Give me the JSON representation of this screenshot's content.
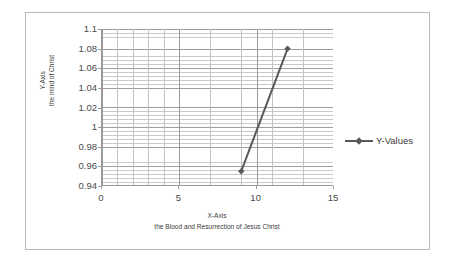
{
  "chart_data": {
    "type": "line",
    "title": "",
    "xlabel": "X-Axis\nthe Blood and Resurrection of Jesus Christ",
    "xlabel_line1": "X-Axis",
    "xlabel_line2": "the Blood and Resurrection of Jesus Christ",
    "ylabel": "Y-Axis\nthe mind of Christ",
    "ylabel_line1": "Y-Axis",
    "ylabel_line2": "the mind of Christ",
    "xlim": [
      0,
      15
    ],
    "ylim": [
      0.94,
      1.1
    ],
    "xticks": [
      0,
      5,
      10,
      15
    ],
    "xtick_labels": [
      "0",
      "5",
      "10",
      "15"
    ],
    "yticks": [
      0.94,
      0.96,
      0.98,
      1.0,
      1.02,
      1.04,
      1.06,
      1.08,
      1.1
    ],
    "ytick_labels": [
      "0.94",
      "0.96",
      "0.98",
      "1",
      "1.02",
      "1.04",
      "1.06",
      "1.08",
      "1.1"
    ],
    "grid": true,
    "grid_minor_horizontal": true,
    "grid_vertical_step": 1,
    "legend_position": "right",
    "series": [
      {
        "name": "Y-Values",
        "color": "#595959",
        "marker": "diamond",
        "x": [
          9,
          12
        ],
        "y": [
          0.955,
          1.08
        ],
        "points": [
          {
            "x": 9,
            "y": 0.955
          },
          {
            "x": 12,
            "y": 1.08
          }
        ]
      }
    ]
  },
  "legend": {
    "entries": [
      {
        "label": "Y-Values",
        "color": "#595959",
        "marker": "diamond"
      }
    ]
  },
  "colors": {
    "series_line": "#595959",
    "axis_line": "#9a9a9a",
    "grid_minor": "#c9c9c9",
    "grid_major": "#9e9e9e",
    "frame_border": "#b9b9b9",
    "tick_text": "#4a4a4a",
    "title_text": "#3c3c3c",
    "background": "#ffffff"
  }
}
